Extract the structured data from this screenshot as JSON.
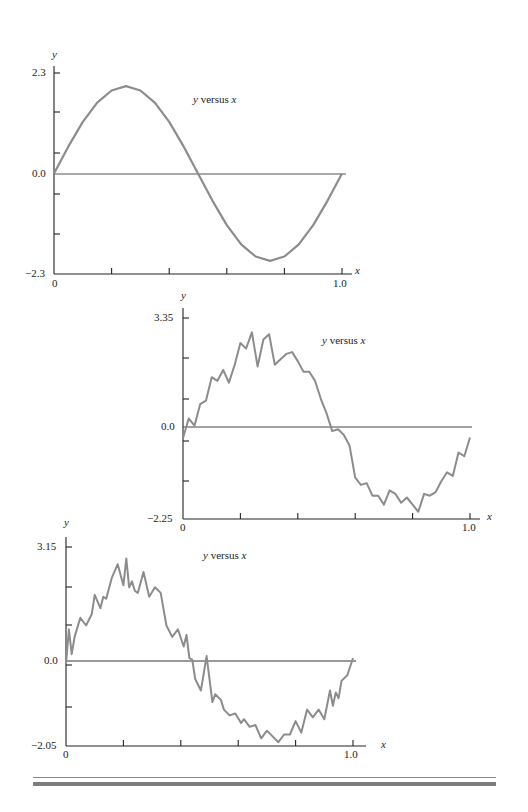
{
  "chart_data": [
    {
      "type": "line",
      "title": "y versus x",
      "xlabel": "x",
      "ylabel": "y",
      "xlim": [
        0,
        1.0
      ],
      "ylim": [
        -2.3,
        2.3
      ],
      "x_tick_labels": [
        "0",
        "1.0"
      ],
      "y_tick_labels": [
        "2.3",
        "0.0",
        "-2.3"
      ],
      "grid": false,
      "legend": null,
      "description": "Smooth sine wave, one period, amplitude ~2.0",
      "series": [
        {
          "name": "y",
          "x": [
            0,
            0.05,
            0.1,
            0.15,
            0.2,
            0.25,
            0.3,
            0.35,
            0.4,
            0.45,
            0.5,
            0.55,
            0.6,
            0.65,
            0.7,
            0.75,
            0.8,
            0.85,
            0.9,
            0.95,
            1.0
          ],
          "values": [
            0.0,
            0.62,
            1.18,
            1.62,
            1.9,
            2.0,
            1.9,
            1.62,
            1.18,
            0.62,
            0.0,
            -0.62,
            -1.18,
            -1.62,
            -1.9,
            -2.0,
            -1.9,
            -1.62,
            -1.18,
            -0.62,
            0.0
          ]
        }
      ]
    },
    {
      "type": "line",
      "title": "y versus x",
      "xlabel": "x",
      "ylabel": "y",
      "xlim": [
        0,
        1.0
      ],
      "ylim": [
        -2.25,
        3.35
      ],
      "x_tick_labels": [
        "0",
        "1.0"
      ],
      "y_tick_labels": [
        "3.35",
        "0.0",
        "-2.25"
      ],
      "grid": false,
      "legend": null,
      "description": "Noisy sine wave, moderate noise",
      "series": [
        {
          "name": "y",
          "x": [
            0,
            0.02,
            0.04,
            0.06,
            0.08,
            0.1,
            0.12,
            0.14,
            0.16,
            0.18,
            0.2,
            0.22,
            0.24,
            0.26,
            0.28,
            0.3,
            0.32,
            0.34,
            0.36,
            0.38,
            0.4,
            0.42,
            0.44,
            0.46,
            0.48,
            0.5,
            0.52,
            0.54,
            0.56,
            0.58,
            0.6,
            0.62,
            0.64,
            0.66,
            0.68,
            0.7,
            0.72,
            0.74,
            0.76,
            0.78,
            0.8,
            0.82,
            0.84,
            0.86,
            0.88,
            0.9,
            0.92,
            0.94,
            0.96,
            0.98,
            1.0
          ],
          "values": [
            0.0,
            0.55,
            0.35,
            0.95,
            1.05,
            1.7,
            1.6,
            1.9,
            1.55,
            2.05,
            2.65,
            2.5,
            2.95,
            2.0,
            2.75,
            2.9,
            2.05,
            2.2,
            2.35,
            2.4,
            2.15,
            1.85,
            1.85,
            1.6,
            1.1,
            0.7,
            0.2,
            0.25,
            0.1,
            -0.2,
            -1.1,
            -1.3,
            -1.25,
            -1.6,
            -1.6,
            -1.85,
            -1.45,
            -1.55,
            -1.8,
            -1.65,
            -1.85,
            -2.05,
            -1.55,
            -1.6,
            -1.5,
            -1.2,
            -0.95,
            -1.05,
            -0.4,
            -0.5,
            0.02
          ]
        }
      ]
    },
    {
      "type": "line",
      "title": "y versus x",
      "xlabel": "x",
      "ylabel": "y",
      "xlim": [
        0,
        1.0
      ],
      "ylim": [
        -2.05,
        3.15
      ],
      "x_tick_labels": [
        "0",
        "1.0"
      ],
      "y_tick_labels": [
        "3.15",
        "0.0",
        "-2.05"
      ],
      "grid": false,
      "legend": null,
      "description": "Noisy sine wave, stronger noise",
      "series": [
        {
          "name": "y",
          "x": [
            0,
            0.01,
            0.02,
            0.03,
            0.05,
            0.07,
            0.09,
            0.1,
            0.12,
            0.13,
            0.14,
            0.16,
            0.18,
            0.2,
            0.21,
            0.22,
            0.23,
            0.24,
            0.25,
            0.27,
            0.29,
            0.31,
            0.33,
            0.35,
            0.37,
            0.39,
            0.41,
            0.42,
            0.43,
            0.44,
            0.45,
            0.47,
            0.49,
            0.51,
            0.52,
            0.54,
            0.55,
            0.57,
            0.59,
            0.61,
            0.62,
            0.64,
            0.66,
            0.68,
            0.7,
            0.72,
            0.74,
            0.76,
            0.78,
            0.8,
            0.82,
            0.84,
            0.86,
            0.88,
            0.9,
            0.92,
            0.93,
            0.94,
            0.95,
            0.96,
            0.98,
            1.0
          ],
          "values": [
            0.1,
            1.0,
            0.35,
            0.8,
            1.3,
            1.1,
            1.4,
            1.9,
            1.55,
            1.85,
            1.8,
            2.35,
            2.7,
            2.15,
            2.85,
            2.1,
            2.25,
            2.0,
            1.95,
            2.5,
            1.85,
            2.1,
            1.95,
            1.1,
            0.8,
            1.0,
            0.55,
            0.85,
            0.25,
            0.2,
            -0.3,
            -0.6,
            0.3,
            -0.9,
            -0.7,
            -0.85,
            -1.1,
            -1.25,
            -1.2,
            -1.45,
            -1.35,
            -1.55,
            -1.5,
            -1.85,
            -1.65,
            -1.8,
            -1.95,
            -1.75,
            -1.75,
            -1.4,
            -1.7,
            -1.1,
            -1.3,
            -1.1,
            -1.35,
            -0.6,
            -1.0,
            -0.65,
            -0.8,
            -0.35,
            -0.2,
            0.25
          ]
        }
      ]
    }
  ],
  "charts": [
    {
      "title": "y versus x",
      "y_label": "y",
      "x_label": "x",
      "y_top": "2.3",
      "y_zero": "0.0",
      "y_bottom": "−2.3",
      "x_start": "0",
      "x_end": "1.0"
    },
    {
      "title": "y versus x",
      "y_label": "y",
      "x_label": "x",
      "y_top": "3.35",
      "y_zero": "0.0",
      "y_bottom": "−2.25",
      "x_start": "0",
      "x_end": "1.0"
    },
    {
      "title": "y versus x",
      "y_label": "y",
      "x_label": "x",
      "y_top": "3.15",
      "y_zero": "0.0",
      "y_bottom": "−2.05",
      "x_start": "0",
      "x_end": "1.0"
    }
  ],
  "colors": {
    "curve": "#8c8c8c",
    "axis": "#222222",
    "rule": "#8a8a8a"
  }
}
